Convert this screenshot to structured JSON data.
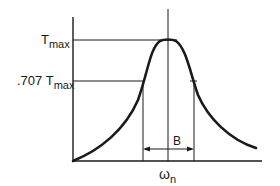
{
  "diagram": {
    "y_labels": {
      "tmax": {
        "base": "T",
        "sub": "max"
      },
      "t707": {
        "prefix": ".707 ",
        "base": "T",
        "sub": "max"
      }
    },
    "x_labels": {
      "omega_n": {
        "base": "ω",
        "sub": "n"
      }
    },
    "bandwidth_label": "B",
    "colors": {
      "line": "#1a1a1a",
      "background": "#ffffff"
    }
  }
}
